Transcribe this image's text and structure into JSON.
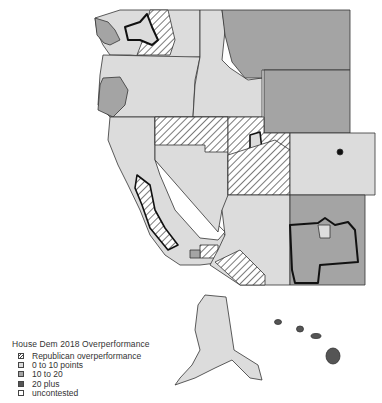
{
  "legend": {
    "title": "House Dem 2018 Overperformance",
    "items": [
      {
        "label": "Republican overperformance",
        "swatch": "hatched",
        "color": "#ffffff"
      },
      {
        "label": "0 to 10 points",
        "swatch": "solid",
        "color": "#dcdcdc"
      },
      {
        "label": "10 to 20",
        "swatch": "solid",
        "color": "#a4a4a4"
      },
      {
        "label": "20 plus",
        "swatch": "solid",
        "color": "#555555"
      },
      {
        "label": "uncontested",
        "swatch": "solid",
        "color": "#ffffff"
      }
    ]
  },
  "map": {
    "region": "Western United States congressional districts (incl. Alaska and Hawaii)",
    "fill_colors": {
      "hatched_republican": "#ffffff",
      "light_0_10": "#dcdcdc",
      "mid_10_20": "#a4a4a4",
      "dark_20_plus": "#555555",
      "uncontested": "#ffffff",
      "border": "#333333"
    }
  }
}
